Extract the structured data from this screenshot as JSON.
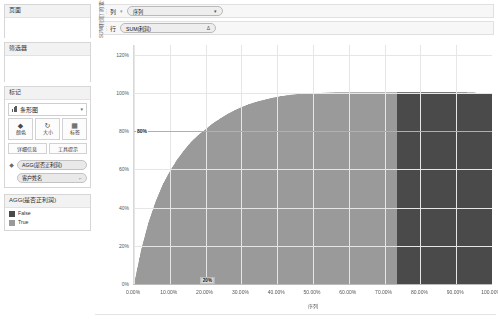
{
  "panel": {
    "pages": {
      "title": "页面"
    },
    "filters": {
      "title": "筛选器"
    },
    "marks": {
      "title": "标记",
      "type_label": "条形图",
      "chevron": "▾",
      "buttons": [
        {
          "name": "color",
          "label": "颜色",
          "glyph": "◆"
        },
        {
          "name": "size",
          "label": "大小",
          "glyph": "↻"
        },
        {
          "name": "label",
          "label": "标签",
          "glyph": "▦"
        }
      ],
      "buttons2": [
        {
          "name": "detail",
          "label": "详细信息"
        },
        {
          "name": "tooltip",
          "label": "工具提示"
        }
      ],
      "pills": [
        {
          "name": "color-pill",
          "icon": "◆",
          "text": "AGG(是否正利润)",
          "tail": ""
        },
        {
          "name": "label-pill",
          "icon": "",
          "text": "客户姓名",
          "tail": "⌐"
        }
      ]
    },
    "legend": {
      "title": "AGG(是否正利润)",
      "items": [
        {
          "label": "False",
          "color": "#4a4a4a"
        },
        {
          "label": "True",
          "color": "#9a9a9a"
        }
      ]
    }
  },
  "shelves": {
    "columns": {
      "label": "列",
      "grip": "⋮⋮",
      "sep": "▾",
      "pill": "序列",
      "tail": "▾"
    },
    "rows": {
      "label": "行",
      "grip": "⋮⋮",
      "pill": "SUM(利润)",
      "tail": "Δ"
    }
  },
  "chart_data": {
    "type": "area",
    "title": "",
    "xlabel": "序列",
    "ylabel": "SUM(利润) 的 累计 百分比",
    "xlim": [
      0,
      100
    ],
    "ylim": [
      0,
      125
    ],
    "grid": true,
    "legend_position": "left-panel",
    "x_ticks": [
      "0.00%",
      "10.00%",
      "20.00%",
      "30.00%",
      "40.00%",
      "50.00%",
      "60.00%",
      "70.00%",
      "80.00%",
      "90.00%",
      "100.00%"
    ],
    "x_tick_values": [
      0,
      10,
      20,
      30,
      40,
      50,
      60,
      70,
      80,
      90,
      100
    ],
    "y_ticks": [
      "0%",
      "20%",
      "40%",
      "60%",
      "80%",
      "100%",
      "120%"
    ],
    "y_tick_values": [
      0,
      20,
      40,
      60,
      80,
      100,
      120
    ],
    "reference_line": {
      "value": 80,
      "label": "80%"
    },
    "drop_label": {
      "x": 20.5,
      "value": "20%"
    },
    "color_split_x": 73.5,
    "colors": {
      "true": "#9a9a9a",
      "false": "#4a4a4a"
    },
    "series": [
      {
        "name": "SUM(利润) 累计百分比",
        "x": [
          0,
          2,
          4,
          6,
          8,
          10,
          12,
          14,
          16,
          18,
          20,
          22,
          24,
          26,
          28,
          30,
          32,
          34,
          36,
          38,
          40,
          42,
          44,
          46,
          48,
          50,
          52,
          54,
          56,
          58,
          60,
          65,
          70,
          75,
          80,
          85,
          90,
          95,
          100
        ],
        "values": [
          0,
          18,
          32,
          43,
          52,
          59,
          65,
          70,
          74.5,
          78,
          81,
          84,
          86.5,
          88.8,
          90.8,
          92.5,
          94,
          95.2,
          96.2,
          97.1,
          97.9,
          98.5,
          99,
          99.4,
          99.7,
          99.9,
          100,
          100.1,
          100.2,
          100.2,
          100.2,
          100.2,
          100.2,
          100.2,
          100.2,
          100.2,
          100.2,
          100.1,
          99.5
        ]
      }
    ]
  }
}
